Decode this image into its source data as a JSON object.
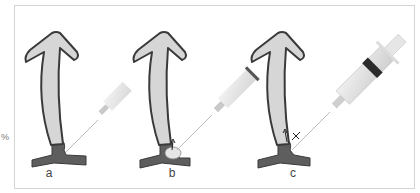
{
  "figure": {
    "side_mark": "%",
    "panels": [
      {
        "id": "a",
        "label": "a",
        "description": "Hair follicle with syringe needle approaching base"
      },
      {
        "id": "b",
        "label": "b",
        "description": "Injection forming bleb at follicle base with upward arrow"
      },
      {
        "id": "c",
        "label": "c",
        "description": "Syringe in close view with arrows at follicle base"
      }
    ],
    "colors": {
      "follicle_fill": "#d6d6d6",
      "follicle_outline": "#3a3a3a",
      "base_fill": "#5e5e5e",
      "syringe_fill": "#e2e2e2",
      "frame_border": "#d4d4d4"
    }
  }
}
